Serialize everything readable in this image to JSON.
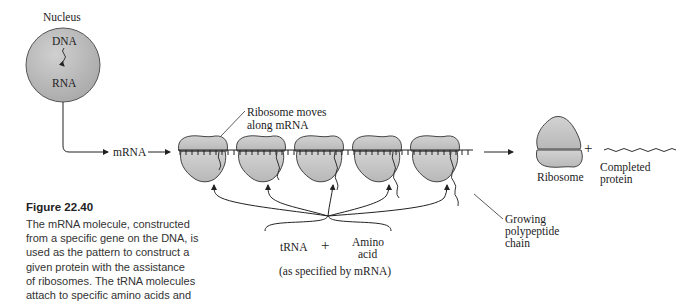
{
  "nucleus": {
    "label": "Nucleus",
    "top_label": "DNA",
    "bottom_label": "RNA",
    "fill": "#b9b9b9"
  },
  "mrna_label": "mRNA",
  "ribosome_callout": [
    "Ribosome moves",
    "along mRNA"
  ],
  "released_ribosome_label": "Ribosome",
  "plus_sign": "+",
  "completed_protein": [
    "Completed",
    "protein"
  ],
  "growing_chain": [
    "Growing",
    "polypeptide",
    "chain"
  ],
  "trna_label": "tRNA",
  "trna_plus": "+",
  "amino_acid": [
    "Amino",
    "acid"
  ],
  "specified_note": "(as specified by mRNA)",
  "caption": {
    "title": "Figure 22.40",
    "lines": [
      "The mRNA molecule, constructed",
      "from a specific gene on the DNA, is",
      "used as the pattern to construct a",
      "given protein with the assistance",
      "of ribosomes. The tRNA molecules",
      "attach to specific amino acids and"
    ]
  },
  "colors": {
    "ribosome_fill": "#c4c4c4",
    "line": "#222222"
  }
}
